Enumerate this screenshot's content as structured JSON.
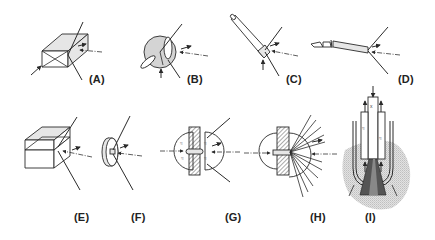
{
  "figure": {
    "panels": [
      {
        "id": "A",
        "label": "(A)",
        "shape": "rectangular-prism-crystal"
      },
      {
        "id": "B",
        "label": "(B)",
        "shape": "sphere-crystal"
      },
      {
        "id": "C",
        "label": "(C)",
        "shape": "rod-crystal-on-fiber"
      },
      {
        "id": "D",
        "label": "(D)",
        "shape": "needle-crystal-in-capillary"
      },
      {
        "id": "E",
        "label": "(E)",
        "shape": "layered-slab-crystal"
      },
      {
        "id": "F",
        "label": "(F)",
        "shape": "disk-crystal"
      },
      {
        "id": "G",
        "label": "(G)",
        "shape": "sandwich-cell-with-hemispheres"
      },
      {
        "id": "H",
        "label": "(H)",
        "shape": "hemisphere-with-scattered-beams"
      },
      {
        "id": "I",
        "label": "(I)",
        "shape": "sample-in-holder-cross-section"
      }
    ],
    "colors": {
      "line": "#2a2a2a",
      "shade_light": "#e6e6e6",
      "shade_mid": "#d4d4d4",
      "shade_dark": "#555555",
      "background_blob": "#d0d0d0"
    }
  }
}
